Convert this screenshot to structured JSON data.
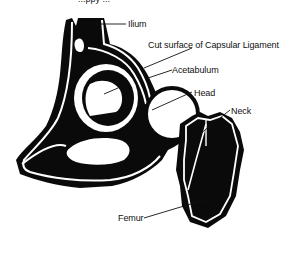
{
  "diagram": {
    "top_caption_partial": "...ppy ...",
    "colors": {
      "fill": "#0a0a0a",
      "background": "#ffffff",
      "text": "#111111"
    },
    "labels": [
      {
        "id": "ilium",
        "text": "Ilium"
      },
      {
        "id": "capsular",
        "text": "Cut surface of Capsular Ligament"
      },
      {
        "id": "acetabulum",
        "text": "Acetabulum"
      },
      {
        "id": "head",
        "text": "Head"
      },
      {
        "id": "neck",
        "text": "Neck"
      },
      {
        "id": "femur",
        "text": "Femur"
      }
    ]
  }
}
